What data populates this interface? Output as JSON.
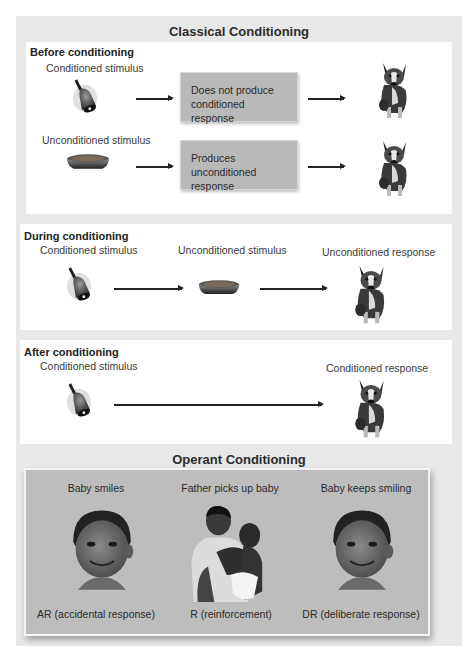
{
  "title": "Classical Conditioning",
  "before": {
    "title": "Before conditioning",
    "row1": {
      "stimulus_label": "Conditioned stimulus",
      "stimulus_icon": "bell-icon",
      "box_text_line1": "Does not produce",
      "box_text_line2": "conditioned response",
      "result_icon": "dog-icon"
    },
    "row2": {
      "stimulus_label": "Unconditioned stimulus",
      "stimulus_icon": "food-bowl-icon",
      "box_text_line1": "Produces unconditioned",
      "box_text_line2": "response",
      "result_icon": "dog-icon"
    }
  },
  "during": {
    "title": "During conditioning",
    "labels": [
      "Conditioned stimulus",
      "Unconditioned stimulus",
      "Unconditioned response"
    ]
  },
  "after": {
    "title": "After conditioning",
    "labels": [
      "Conditioned stimulus",
      "Conditioned response"
    ]
  },
  "operant": {
    "title": "Operant Conditioning",
    "columns": [
      {
        "top": "Baby smiles",
        "bottom": "AR (accidental response)",
        "icon": "baby-face-icon"
      },
      {
        "top": "Father picks up baby",
        "bottom": "R (reinforcement)",
        "icon": "father-holding-baby-icon"
      },
      {
        "top": "Baby keeps smiling",
        "bottom": "DR (deliberate response)",
        "icon": "baby-face-icon"
      }
    ]
  },
  "colors": {
    "outer_bg": "#e8e8e8",
    "panel_bg": "#ffffff",
    "box_bg": "#b9b9b9",
    "operant_bg": "#bdbdbd"
  }
}
